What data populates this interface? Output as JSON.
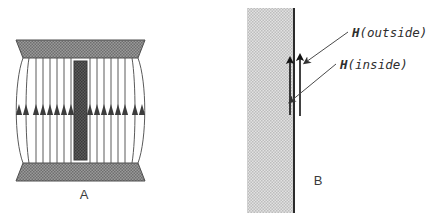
{
  "figure": {
    "width": 439,
    "height": 223,
    "background": "#ffffff",
    "colors": {
      "plate_fill": "#8a8a8a",
      "plate_stroke": "#555555",
      "core_fill": "#4a4a4a",
      "core_stroke": "#333333",
      "field_line": "#5a5a5a",
      "medium_fill": "#c9c9c9",
      "boundary_line": "#2b2b2b",
      "arrow": "#1a1a1a",
      "leader_line": "#555555",
      "text": "#2e2e2e"
    }
  },
  "panel_a": {
    "caption": "A",
    "caption_x": 84,
    "caption_y": 199,
    "description": "Parallel-plate capacitor with dielectric slab and vertical field lines",
    "top_plate": {
      "name": "top-plate",
      "points": "16,40 145,40 138,58 23,58"
    },
    "bottom_plate": {
      "name": "bottom-plate",
      "points": "23,163 138,163 145,181 16,181"
    },
    "core_slab": {
      "name": "core-slab",
      "x": 74,
      "y": 61,
      "width": 13,
      "height": 99
    },
    "field_lines": {
      "top_y": 58,
      "bottom_y": 163,
      "arrow_y": 110,
      "straight_x": [
        29,
        36,
        43,
        50,
        57,
        64,
        71,
        90,
        97,
        104,
        111,
        118,
        125,
        132
      ],
      "fringe_left": {
        "top_x": 23,
        "bulge_x": 15,
        "bottom_x": 23
      },
      "fringe_right": {
        "top_x": 138,
        "bulge_x": 146,
        "bottom_x": 138
      }
    }
  },
  "panel_b": {
    "caption": "B",
    "caption_x": 318,
    "caption_y": 185,
    "description": "Boundary between magnetic medium and free space with H field arrows",
    "medium": {
      "name": "magnetic-medium",
      "x": 247,
      "y": 8,
      "width": 47,
      "height": 205
    },
    "boundary": {
      "name": "boundary-line",
      "x": 294,
      "y_top": 8,
      "y_bottom": 213
    },
    "arrow_inside": {
      "name": "h-inside-arrow",
      "x": 290,
      "y_tail": 115,
      "y_head": 57
    },
    "arrow_outside": {
      "name": "h-outside-arrow",
      "x": 300,
      "y_tail": 116,
      "y_head": 54
    },
    "labels": [
      {
        "id": "h-outside",
        "vector": "H",
        "qualifier": "(outside)",
        "x": 352,
        "y": 37,
        "leader": {
          "x1": 347,
          "y1": 32,
          "x2": 303,
          "y2": 63
        }
      },
      {
        "id": "h-inside",
        "vector": "H",
        "qualifier": "(inside)",
        "x": 340,
        "y": 69,
        "leader": {
          "x1": 335,
          "y1": 64,
          "x2": 288,
          "y2": 102
        }
      }
    ]
  }
}
